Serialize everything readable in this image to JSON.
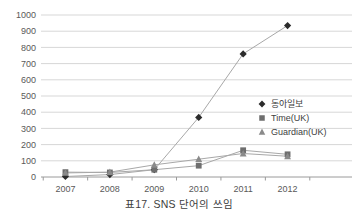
{
  "caption": "표17. SNS 단어의 쓰임",
  "chart_data": {
    "type": "line",
    "title": "",
    "xlabel": "",
    "ylabel": "",
    "categories": [
      "2007",
      "2008",
      "2009",
      "2010",
      "2011",
      "2012"
    ],
    "ylim": [
      0,
      1000
    ],
    "ytick_step": 100,
    "yticks": [
      "0",
      "100",
      "200",
      "300",
      "400",
      "500",
      "600",
      "700",
      "800",
      "900",
      "1000"
    ],
    "grid": "horizontal",
    "legend_position": "right-middle",
    "series": [
      {
        "name": "동아일보",
        "marker": "diamond",
        "color": "#2b2b2b",
        "values": [
          3,
          15,
          45,
          368,
          760,
          935
        ]
      },
      {
        "name": "Time(UK)",
        "marker": "square",
        "color": "#6e6e6e",
        "values": [
          30,
          28,
          45,
          70,
          165,
          140
        ]
      },
      {
        "name": "Guardian(UK)",
        "marker": "triangle",
        "color": "#8a8a8a",
        "values": [
          25,
          30,
          75,
          110,
          145,
          128
        ]
      }
    ]
  },
  "colors": {
    "grid": "#d7d7d7",
    "axis": "#9a9a9a",
    "line": "#a8a8a8",
    "text": "#4a4a4a"
  }
}
